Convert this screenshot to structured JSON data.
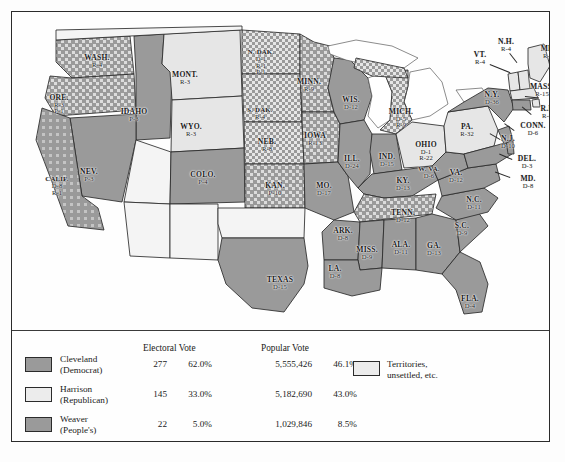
{
  "map": {
    "title": "Election of 1892",
    "colors": {
      "democrat": "#9a9a9a",
      "republican": "#e6e6e6",
      "peoples": "#9a9a9a",
      "territory": "#ffffff",
      "mixed_light": "#cfcfcf",
      "border": "#2b2b2b",
      "background": "#fefefe"
    },
    "states": [
      {
        "abbr": "WASH.",
        "lines": [
          "R-4"
        ],
        "x": 85,
        "y": 49
      },
      {
        "abbr": "ORE.",
        "lines": [
          "R-3",
          "P-1"
        ],
        "x": 47,
        "y": 93
      },
      {
        "abbr": "IDAHO",
        "lines": [
          "P-3"
        ],
        "x": 122,
        "y": 103
      },
      {
        "abbr": "MONT.",
        "lines": [
          "R-3"
        ],
        "x": 173,
        "y": 66
      },
      {
        "abbr": "WYO.",
        "lines": [
          "R-3"
        ],
        "x": 179,
        "y": 118
      },
      {
        "abbr": "NEV.",
        "lines": [
          "P-3"
        ],
        "x": 77,
        "y": 163
      },
      {
        "abbr": "CALIF.",
        "lines": [
          "D-8",
          "R-1"
        ],
        "x": 45,
        "y": 174
      },
      {
        "abbr": "COLO.",
        "lines": [
          "P-4"
        ],
        "x": 191,
        "y": 166
      },
      {
        "abbr": "N. DAK.",
        "lines": [
          "D-1",
          "R-1",
          "P-1"
        ],
        "x": 249,
        "y": 51
      },
      {
        "abbr": "S. DAK.",
        "lines": [
          "R-4"
        ],
        "x": 248,
        "y": 102
      },
      {
        "abbr": "NEB.",
        "lines": [
          "R-8"
        ],
        "x": 255,
        "y": 133
      },
      {
        "abbr": "KAN.",
        "lines": [
          "P-10"
        ],
        "x": 263,
        "y": 177
      },
      {
        "abbr": "MINN.",
        "lines": [
          "R-9"
        ],
        "x": 297,
        "y": 73
      },
      {
        "abbr": "IOWA",
        "lines": [
          "R-13"
        ],
        "x": 303,
        "y": 127
      },
      {
        "abbr": "MO.",
        "lines": [
          "D-17"
        ],
        "x": 312,
        "y": 177
      },
      {
        "abbr": "WIS.",
        "lines": [
          "D-12"
        ],
        "x": 339,
        "y": 91
      },
      {
        "abbr": "ILL.",
        "lines": [
          "D-24"
        ],
        "x": 340,
        "y": 150
      },
      {
        "abbr": "IND.",
        "lines": [
          "D-15"
        ],
        "x": 375,
        "y": 148
      },
      {
        "abbr": "MICH.",
        "lines": [
          "D-5",
          "R-9"
        ],
        "x": 389,
        "y": 107
      },
      {
        "abbr": "OHIO",
        "lines": [
          "D-1",
          "R-22"
        ],
        "x": 414,
        "y": 140
      },
      {
        "abbr": "KY.",
        "lines": [
          "D-13"
        ],
        "x": 391,
        "y": 172
      },
      {
        "abbr": "TENN.",
        "lines": [
          "D-12"
        ],
        "x": 391,
        "y": 204
      },
      {
        "abbr": "ARK.",
        "lines": [
          "D-8"
        ],
        "x": 331,
        "y": 222
      },
      {
        "abbr": "MISS.",
        "lines": [
          "D-9"
        ],
        "x": 355,
        "y": 241
      },
      {
        "abbr": "ALA.",
        "lines": [
          "D-11"
        ],
        "x": 389,
        "y": 236
      },
      {
        "abbr": "GA.",
        "lines": [
          "D-13"
        ],
        "x": 422,
        "y": 237
      },
      {
        "abbr": "LA.",
        "lines": [
          "D-8"
        ],
        "x": 323,
        "y": 260
      },
      {
        "abbr": "TEXAS",
        "lines": [
          "D-15"
        ],
        "x": 268,
        "y": 271
      },
      {
        "abbr": "FLA.",
        "lines": [
          "D-4"
        ],
        "x": 458,
        "y": 290
      },
      {
        "abbr": "S.C.",
        "lines": [
          "D-9"
        ],
        "x": 450,
        "y": 217
      },
      {
        "abbr": "N.C.",
        "lines": [
          "D-11"
        ],
        "x": 462,
        "y": 191
      },
      {
        "abbr": "VA.",
        "lines": [
          "D-12"
        ],
        "x": 444,
        "y": 164
      },
      {
        "abbr": "W. VA.",
        "lines": [
          "D-6"
        ],
        "x": 417,
        "y": 161
      },
      {
        "abbr": "PA.",
        "lines": [
          "R-32"
        ],
        "x": 455,
        "y": 118
      },
      {
        "abbr": "N.Y.",
        "lines": [
          "D-36"
        ],
        "x": 480,
        "y": 86
      }
    ],
    "callouts": [
      {
        "abbr": "ME.",
        "lines": [
          "R-6"
        ],
        "x": 536,
        "y": 40,
        "align": "center"
      },
      {
        "abbr": "N.H.",
        "lines": [
          "R-4"
        ],
        "x": 494,
        "y": 33,
        "align": "center"
      },
      {
        "abbr": "VT.",
        "lines": [
          "R-4"
        ],
        "x": 468,
        "y": 46,
        "align": "center"
      },
      {
        "abbr": "MASS.",
        "lines": [
          "R-15"
        ],
        "x": 530,
        "y": 78,
        "align": "center"
      },
      {
        "abbr": "R.I.",
        "lines": [
          "R-4"
        ],
        "x": 535,
        "y": 100,
        "align": "center"
      },
      {
        "abbr": "CONN.",
        "lines": [
          "D-6"
        ],
        "x": 521,
        "y": 117,
        "align": "center"
      },
      {
        "abbr": "N.J.",
        "lines": [
          "D-10"
        ],
        "x": 496,
        "y": 130,
        "align": "center"
      },
      {
        "abbr": "DEL.",
        "lines": [
          "D-3"
        ],
        "x": 515,
        "y": 150,
        "align": "center"
      },
      {
        "abbr": "MD.",
        "lines": [
          "D-8"
        ],
        "x": 516,
        "y": 170,
        "align": "center"
      }
    ]
  },
  "legend": {
    "headers": {
      "electoral": "Electoral Vote",
      "popular": "Popular Vote"
    },
    "rows": [
      {
        "name": "Cleveland",
        "party": "(Democrat)",
        "electoral": "277",
        "electoral_pct": "62.0%",
        "popular": "5,555,426",
        "popular_pct": "46.1%",
        "swatch": "#9a9a9a"
      },
      {
        "name": "Harrison",
        "party": "(Republican)",
        "electoral": "145",
        "electoral_pct": "33.0%",
        "popular": "5,182,690",
        "popular_pct": "43.0%",
        "swatch": "#ececec"
      },
      {
        "name": "Weaver",
        "party": "(People's)",
        "electoral": "22",
        "electoral_pct": "5.0%",
        "popular": "1,029,846",
        "popular_pct": "8.5%",
        "swatch": "#9a9a9a"
      }
    ],
    "territory": {
      "line1": "Territories,",
      "line2": "unsettled, etc.",
      "swatch": "#ececec"
    }
  }
}
